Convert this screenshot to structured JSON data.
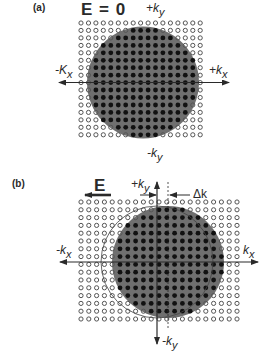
{
  "panel_a": {
    "label": "(a)",
    "field_label": "E = 0",
    "axes": {
      "plus_ky": {
        "sign": "+",
        "base": "k",
        "sub": "y"
      },
      "minus_ky": {
        "sign": "-",
        "base": "k",
        "sub": "y"
      },
      "plus_kx": {
        "sign": "+",
        "base": "k",
        "sub": "x"
      },
      "minus_kx": {
        "sign": "-",
        "base": "K",
        "sub": "x"
      }
    },
    "grid": {
      "cols": 17,
      "rows": 16,
      "x0": 81,
      "y0": 23,
      "pitch": 7.45
    },
    "fermi_circle": {
      "cx": 143,
      "cy": 82.5,
      "r": 56
    }
  },
  "panel_b": {
    "label": "(b)",
    "field_label": "E",
    "delta_label": "Δk",
    "axes": {
      "plus_ky": {
        "sign": "+",
        "base": "k",
        "sub": "y"
      },
      "minus_ky": {
        "sign": "-",
        "base": "k",
        "sub": "y"
      },
      "plus_kx": {
        "sign": "",
        "base": "k",
        "sub": "x"
      },
      "minus_kx": {
        "sign": "-",
        "base": "k",
        "sub": "x"
      }
    },
    "grid": {
      "cols": 21,
      "rows": 16,
      "x0": 81,
      "y0": 202,
      "pitch": 7.8
    },
    "shifted_circle": {
      "cx": 168,
      "cy": 262,
      "r": 56
    },
    "original_circle": {
      "cx": 157,
      "cy": 262,
      "r": 56
    }
  },
  "colors": {
    "shade": "#6f6f6f",
    "filled_dot": "#111111",
    "empty_dot": "#555555",
    "line": "#2a2a2a"
  }
}
